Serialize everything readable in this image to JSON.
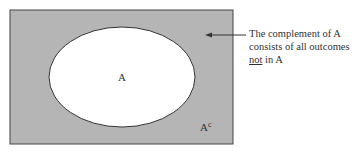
{
  "diagram": {
    "sample_space": {
      "fill": "#b5b5b5",
      "stroke": "#444444"
    },
    "event_a": {
      "label": "A",
      "fill": "#ffffff",
      "stroke": "#333333"
    },
    "complement": {
      "label_base": "A",
      "label_sup": "c"
    },
    "annotation": {
      "line1": "The complement of A",
      "line2": "consists of all outcomes",
      "line3_underlined": "not",
      "line3_rest": " in A"
    }
  }
}
